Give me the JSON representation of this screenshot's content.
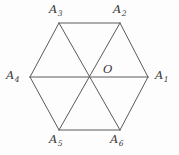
{
  "figure": {
    "name": "regular-hexagon-with-diagonals",
    "background_color": "#fdfdfd",
    "stroke_color": "#5a5a5a",
    "label_color": "#3a3a3a",
    "stroke_width": 1,
    "center": {
      "label": "O",
      "x": 89,
      "y": 77,
      "label_x": 103,
      "label_y": 64
    },
    "vertices": [
      {
        "id": "A1",
        "letter": "A",
        "subscript": "1",
        "x": 148,
        "y": 77,
        "label_x": 155,
        "label_y": 70
      },
      {
        "id": "A2",
        "letter": "A",
        "subscript": "2",
        "x": 120,
        "y": 23,
        "label_x": 113,
        "label_y": 4
      },
      {
        "id": "A3",
        "letter": "A",
        "subscript": "3",
        "x": 59,
        "y": 23,
        "label_x": 49,
        "label_y": 4
      },
      {
        "id": "A4",
        "letter": "A",
        "subscript": "4",
        "x": 30,
        "y": 77,
        "label_x": 6,
        "label_y": 70
      },
      {
        "id": "A5",
        "letter": "A",
        "subscript": "5",
        "x": 59,
        "y": 130,
        "label_x": 49,
        "label_y": 134
      },
      {
        "id": "A6",
        "letter": "A",
        "subscript": "6",
        "x": 120,
        "y": 130,
        "label_x": 110,
        "label_y": 134
      }
    ],
    "edges": [
      {
        "name": "edge-A1-A2",
        "from": "A1",
        "to": "A2"
      },
      {
        "name": "edge-A2-A3",
        "from": "A2",
        "to": "A3"
      },
      {
        "name": "edge-A3-A4",
        "from": "A3",
        "to": "A4"
      },
      {
        "name": "edge-A4-A5",
        "from": "A4",
        "to": "A5"
      },
      {
        "name": "edge-A5-A6",
        "from": "A5",
        "to": "A6"
      },
      {
        "name": "edge-A6-A1",
        "from": "A6",
        "to": "A1"
      }
    ],
    "diagonals": [
      {
        "name": "diagonal-A1-A4",
        "from": "A1",
        "to": "A4"
      },
      {
        "name": "diagonal-A2-A5",
        "from": "A2",
        "to": "A5"
      },
      {
        "name": "diagonal-A3-A6",
        "from": "A3",
        "to": "A6"
      }
    ]
  }
}
